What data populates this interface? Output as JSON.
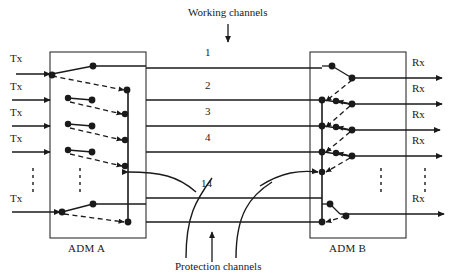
{
  "figure": {
    "type": "network-protection-switching-diagram",
    "top_caption": "Working channels",
    "bottom_caption": "Protection channels"
  },
  "nodes": [
    {
      "id": "adm-a",
      "label": "ADM A",
      "x": 50,
      "y": 52,
      "w": 96,
      "h": 186,
      "bus_x": 128,
      "bus_y1": 88,
      "bus_y2": 225
    },
    {
      "id": "adm-b",
      "label": "ADM B",
      "x": 310,
      "y": 52,
      "w": 96,
      "h": 186,
      "bus_x": 322,
      "bus_y1": 100,
      "bus_y2": 222
    }
  ],
  "channels": [
    {
      "number": "1",
      "y": 68,
      "label_y": 52
    },
    {
      "number": "2",
      "y": 100,
      "label_y": 85
    },
    {
      "number": "3",
      "y": 126,
      "label_y": 111
    },
    {
      "number": "4",
      "y": 152,
      "label_y": 137
    },
    {
      "number": "14",
      "y": 198,
      "label_y": 183
    }
  ],
  "tx_ports": [
    {
      "label": "Tx",
      "y": 74,
      "label_y": 56
    },
    {
      "label": "Tx",
      "y": 100,
      "label_y": 84
    },
    {
      "label": "Tx",
      "y": 126,
      "label_y": 110
    },
    {
      "label": "Tx",
      "y": 152,
      "label_y": 136
    },
    {
      "label": "Tx",
      "y": 212,
      "label_y": 196
    }
  ],
  "rx_ports": [
    {
      "label": "Rx",
      "y": 78,
      "label_y": 60
    },
    {
      "label": "Rx",
      "y": 104,
      "label_y": 86
    },
    {
      "label": "Rx",
      "y": 130,
      "label_y": 112
    },
    {
      "label": "Rx",
      "y": 156,
      "label_y": 138
    },
    {
      "label": "Rx",
      "y": 214,
      "label_y": 196
    }
  ],
  "ellipses": [
    {
      "x": 33,
      "y1": 168,
      "y2": 196
    },
    {
      "x": 80,
      "y1": 168,
      "y2": 196
    },
    {
      "x": 381,
      "y1": 168,
      "y2": 196
    },
    {
      "x": 425,
      "y1": 168,
      "y2": 196
    }
  ],
  "colors": {
    "stroke": "#1a1a1a",
    "background": "#ffffff"
  }
}
